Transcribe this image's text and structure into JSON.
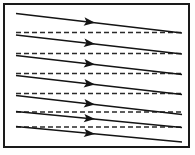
{
  "figure": {
    "title": "Slanted flow arrows over horizontal dashed reference lines",
    "caption": "",
    "background_color": "#ffffff",
    "frame": {
      "name": "outer-border",
      "x": 3,
      "y": 3,
      "width": 187,
      "height": 145,
      "stroke_color": "#1a1a1a",
      "stroke_width": 2,
      "fill_color": "#ffffff"
    }
  },
  "chart_data": {
    "type": "diagram",
    "title": "Slanted flow arrows over horizontal dashed reference lines",
    "xlabel": "",
    "ylabel": "",
    "grid": false,
    "legend_position": "none",
    "axis_ranges": {
      "x": [
        3,
        190
      ],
      "y": [
        3,
        148
      ]
    },
    "solid_arrow_color": "#141414",
    "solid_arrow_width": 1.4,
    "dashed_line_color": "#2a2a2a",
    "dashed_line_width": 1.4,
    "dash_pattern": "5,3",
    "arrowhead_x": 95,
    "arrowhead_length": 11,
    "arrowhead_half_width": 4.2,
    "solid_arrows": [
      {
        "label": "arrow-1",
        "x1": 16,
        "y1": 13.5,
        "x2": 182,
        "y2": 33.0
      },
      {
        "label": "arrow-2",
        "x1": 16,
        "y1": 35.0,
        "x2": 182,
        "y2": 54.0
      },
      {
        "label": "arrow-3",
        "x1": 16,
        "y1": 55.5,
        "x2": 182,
        "y2": 74.5
      },
      {
        "label": "arrow-4",
        "x1": 16,
        "y1": 75.5,
        "x2": 182,
        "y2": 94.5
      },
      {
        "label": "arrow-5",
        "x1": 16,
        "y1": 95.5,
        "x2": 182,
        "y2": 114.5
      },
      {
        "label": "arrow-6",
        "x1": 16,
        "y1": 111.5,
        "x2": 182,
        "y2": 127.5
      },
      {
        "label": "arrow-7",
        "x1": 16,
        "y1": 126.5,
        "x2": 182,
        "y2": 142.0
      }
    ],
    "dashed_lines": [
      {
        "label": "dashed-1",
        "x1": 16,
        "y1": 32.5,
        "x2": 182,
        "y2": 32.5
      },
      {
        "label": "dashed-2",
        "y1": 53.5,
        "x1": 16,
        "x2": 182,
        "y2": 53.5
      },
      {
        "label": "dashed-3",
        "x1": 16,
        "y1": 73.5,
        "x2": 182,
        "y2": 73.5
      },
      {
        "label": "dashed-4",
        "x1": 16,
        "y1": 93.5,
        "x2": 182,
        "y2": 93.5
      },
      {
        "label": "dashed-5",
        "x1": 16,
        "y1": 112.0,
        "x2": 182,
        "y2": 112.0
      },
      {
        "label": "dashed-6",
        "x1": 16,
        "y1": 127.0,
        "x2": 182,
        "y2": 127.0
      }
    ],
    "counts": {
      "solid_arrows": 7,
      "dashed_lines": 6
    }
  }
}
